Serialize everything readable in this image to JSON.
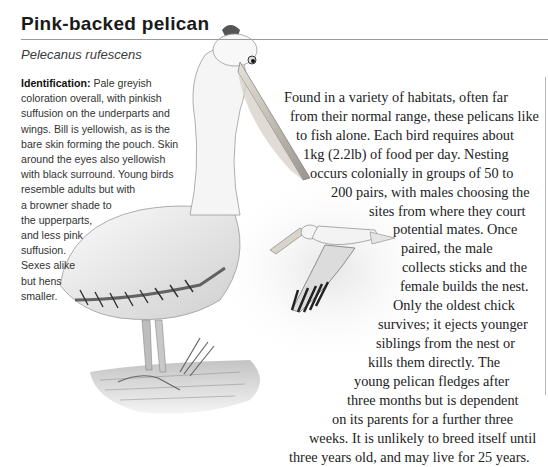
{
  "header": {
    "title": "Pink-backed pelican",
    "scientific_name": "Pelecanus rufescens"
  },
  "identification": {
    "label": "Identification:",
    "lines": [
      " Pale greyish",
      "coloration overall, with pinkish",
      "suffusion on the underparts and",
      "wings. Bill is yellowish, as is the",
      "bare skin forming the pouch. Skin",
      "around the eyes also yellowish",
      "with black surround. Young birds",
      "resemble adults but with",
      "a browner shade to",
      "the upperparts,",
      "and less pink",
      "suffusion.",
      "Sexes alike",
      "but hens",
      "smaller."
    ]
  },
  "description": {
    "lines": [
      "Found in a variety of habitats, often far",
      "from their normal range, these pelicans like",
      "to fish alone. Each bird requires about",
      "1kg (2.2lb) of food per day. Nesting",
      "occurs colonially in groups of 50 to",
      "200 pairs, with males choosing the",
      "sites from where they court",
      "potential mates. Once",
      "paired, the male",
      "collects sticks and the",
      "female builds the nest.",
      "Only the oldest chick",
      "survives; it ejects younger",
      "siblings from the nest or",
      "kills them directly. The",
      "young pelican fledges after",
      "three months but is dependent",
      "on its parents for a further three",
      "weeks. It is unlikely to breed itself until",
      "three years old, and may live for 25 years."
    ]
  },
  "illustrations": {
    "main": "standing-pelican-illustration",
    "inset": "flying-pelican-illustration"
  }
}
